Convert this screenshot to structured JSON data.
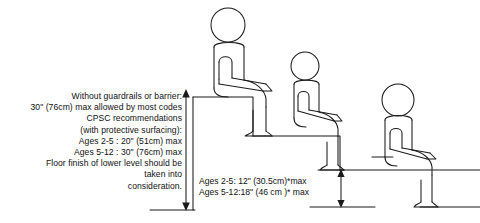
{
  "diagram": {
    "ink_color": "#1a1a1a"
  },
  "left_note": {
    "lines": [
      "Without guardrails or barrier:",
      "30\" (76cm) max allowed by most codes",
      "CPSC  recommendations",
      "(with protective surfacing):",
      "Ages 2-5 : 20\" (51cm) max",
      "Ages 5-12 : 30\" (76cm) max",
      "Floor finish of lower level should be",
      "taken into",
      "consideration."
    ]
  },
  "riser_note": {
    "lines": [
      "Ages 2-5: 12\" (30.5cm)*max",
      "Ages 5-12:18\" (46 cm )* max"
    ]
  },
  "figures": [
    {
      "name": "seated-child-top-step"
    },
    {
      "name": "seated-child-middle-step"
    },
    {
      "name": "seated-child-bottom-step"
    }
  ],
  "dimensions": [
    {
      "name": "fall-height-dimension",
      "orientation": "vertical"
    },
    {
      "name": "riser-height-dimension",
      "orientation": "vertical"
    }
  ]
}
